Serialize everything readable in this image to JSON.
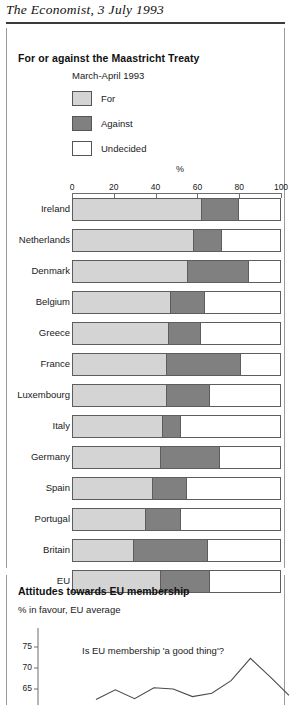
{
  "masthead": "The Economist, 3 July 1993",
  "panel1": {
    "title": "For or against the Maastricht Treaty",
    "period": "March-April 1993",
    "unit": "%",
    "legend": [
      {
        "key": "for",
        "label": "For",
        "color": "#d4d4d4"
      },
      {
        "key": "against",
        "label": "Against",
        "color": "#808080"
      },
      {
        "key": "undecided",
        "label": "Undecided",
        "color": "#ffffff"
      }
    ]
  },
  "panel2": {
    "title": "Attitudes towards EU membership",
    "subtitle": "% in favour, EU average",
    "caption": "Is EU membership 'a good thing'?",
    "yticks": [
      "75",
      "70",
      "65"
    ]
  },
  "chart_data": [
    {
      "type": "bar",
      "orientation": "horizontal",
      "stacked": true,
      "title": "For or against the Maastricht Treaty",
      "subtitle": "March-April 1993",
      "xlabel": "%",
      "ylabel": "",
      "xlim": [
        0,
        100
      ],
      "xticks": [
        0,
        20,
        40,
        60,
        80,
        100
      ],
      "grid": false,
      "legend_position": "top-left",
      "categories": [
        "Ireland",
        "Netherlands",
        "Denmark",
        "Belgium",
        "Greece",
        "France",
        "Luxembourg",
        "Italy",
        "Germany",
        "Spain",
        "Portugal",
        "Britain",
        "EU"
      ],
      "series": [
        {
          "name": "For",
          "color": "#d4d4d4",
          "values": [
            62,
            58,
            55,
            47,
            46,
            45,
            45,
            43,
            42,
            38,
            35,
            29,
            42
          ]
        },
        {
          "name": "Against",
          "color": "#808080",
          "values": [
            18,
            14,
            30,
            17,
            16,
            36,
            21,
            9,
            29,
            17,
            17,
            36,
            24
          ]
        },
        {
          "name": "Undecided",
          "color": "#ffffff",
          "values": [
            20,
            28,
            15,
            36,
            38,
            19,
            34,
            48,
            29,
            45,
            48,
            35,
            34
          ]
        }
      ]
    },
    {
      "type": "line",
      "title": "Attitudes towards EU membership",
      "subtitle": "% in favour, EU average",
      "annotation": "Is EU membership 'a good thing'?",
      "ylabel": "% in favour, EU average",
      "ylim": [
        62,
        77
      ],
      "yticks": [
        75,
        70,
        65
      ],
      "grid": false,
      "series": [
        {
          "name": "EU average",
          "values": [
            62.5,
            64.8,
            62.7,
            65.3,
            65.0,
            63.2,
            64.0,
            67.0,
            72.3,
            68.0,
            63.5
          ]
        }
      ]
    }
  ]
}
